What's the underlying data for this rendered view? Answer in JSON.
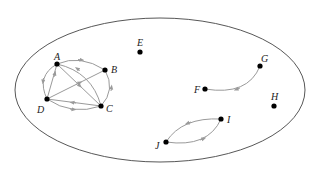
{
  "diagram": {
    "type": "directed-graph",
    "container": "ellipse",
    "colors": {
      "node": "#000000",
      "edge": "#9a9a9a",
      "boundary": "#333333",
      "label": "#222222"
    },
    "nodes": [
      {
        "id": "A",
        "label": "A",
        "x": 57,
        "y": 64
      },
      {
        "id": "B",
        "label": "B",
        "x": 105,
        "y": 70
      },
      {
        "id": "C",
        "label": "C",
        "x": 101,
        "y": 106
      },
      {
        "id": "D",
        "label": "D",
        "x": 47,
        "y": 99
      },
      {
        "id": "E",
        "label": "E",
        "x": 140,
        "y": 52
      },
      {
        "id": "F",
        "label": "F",
        "x": 205,
        "y": 89
      },
      {
        "id": "G",
        "label": "G",
        "x": 260,
        "y": 66
      },
      {
        "id": "H",
        "label": "H",
        "x": 274,
        "y": 106
      },
      {
        "id": "I",
        "label": "I",
        "x": 221,
        "y": 119
      },
      {
        "id": "J",
        "label": "J",
        "x": 166,
        "y": 142
      }
    ],
    "edges": [
      {
        "from": "A",
        "to": "B",
        "shape": "curve"
      },
      {
        "from": "C",
        "to": "B",
        "shape": "curve"
      },
      {
        "from": "D",
        "to": "C",
        "shape": "curve"
      },
      {
        "from": "A",
        "to": "D",
        "shape": "curve"
      },
      {
        "from": "D",
        "to": "A",
        "shape": "straight"
      },
      {
        "from": "D",
        "to": "B",
        "shape": "straight"
      },
      {
        "from": "A",
        "to": "C",
        "shape": "straight"
      },
      {
        "from": "C",
        "to": "D",
        "shape": "straight"
      },
      {
        "from": "C",
        "to": "A",
        "shape": "curve"
      },
      {
        "from": "G",
        "to": "F",
        "shape": "curve"
      },
      {
        "from": "I",
        "to": "J",
        "shape": "curve"
      },
      {
        "from": "J",
        "to": "I",
        "shape": "curve"
      }
    ]
  }
}
